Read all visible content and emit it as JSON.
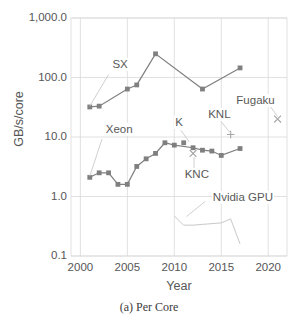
{
  "chart_data": {
    "type": "line",
    "title": "",
    "caption": "(a) Per Core",
    "xlabel": "Year",
    "ylabel": "GB/s/core",
    "yscale": "log",
    "ylim": [
      0.1,
      1000.0
    ],
    "xlim": [
      1999,
      2022
    ],
    "grid": true,
    "legend_position": "inline-annotations",
    "xticks": [
      "2000",
      "2005",
      "2010",
      "2015",
      "2020"
    ],
    "xtick_values": [
      2000,
      2005,
      2010,
      2015,
      2020
    ],
    "yticks": [
      "1,000.0",
      "100.0",
      "10.0",
      "1.0",
      "0.1"
    ],
    "ytick_values": [
      1000.0,
      100.0,
      10.0,
      1.0,
      0.1
    ],
    "series": [
      {
        "name": "SX",
        "marker": "square",
        "color": "#808080",
        "x": [
          2001,
          2002,
          2005,
          2006,
          2008,
          2013,
          2017
        ],
        "values": [
          32.0,
          33.0,
          64.0,
          75.0,
          250.0,
          64.0,
          145.0
        ]
      },
      {
        "name": "Xeon",
        "marker": "square",
        "color": "#7f7f7f",
        "x": [
          2001,
          2002,
          2003,
          2004,
          2005,
          2006,
          2007,
          2008,
          2009,
          2010,
          2012,
          2013,
          2014,
          2015,
          2017
        ],
        "values": [
          2.1,
          2.5,
          2.5,
          1.6,
          1.6,
          3.2,
          4.3,
          5.3,
          8.0,
          7.3,
          6.6,
          6.0,
          5.8,
          4.9,
          6.4
        ]
      },
      {
        "name": "K",
        "marker": "square",
        "color": "#808080",
        "x": [
          2011
        ],
        "values": [
          8.0
        ]
      },
      {
        "name": "KNC",
        "marker": "x",
        "color": "#a6a6a6",
        "x": [
          2012
        ],
        "values": [
          5.3
        ]
      },
      {
        "name": "KNL",
        "marker": "plus",
        "color": "#a6a6a6",
        "x": [
          2016
        ],
        "values": [
          11.0
        ]
      },
      {
        "name": "Fugaku",
        "marker": "x",
        "color": "#a6a6a6",
        "x": [
          2021
        ],
        "values": [
          20.0
        ]
      },
      {
        "name": "Nvidia GPU",
        "marker": "none",
        "color": "#c9c9c9",
        "x": [
          2010,
          2011,
          2012,
          2013,
          2015,
          2016,
          2017
        ],
        "values": [
          0.47,
          0.33,
          0.33,
          0.34,
          0.36,
          0.42,
          0.16
        ]
      }
    ],
    "annotations": [
      {
        "text": "SX",
        "x": 2003.3,
        "y": 165.0
      },
      {
        "text": "Xeon",
        "x": 2002.6,
        "y": 13.0
      },
      {
        "text": "K",
        "x": 2010.0,
        "y": 17.0
      },
      {
        "text": "KNC",
        "x": 2011.0,
        "y": 2.3
      },
      {
        "text": "KNL",
        "x": 2013.5,
        "y": 23.0
      },
      {
        "text": "Fugaku",
        "x": 2016.5,
        "y": 40.0
      },
      {
        "text": "Nvidia GPU",
        "x": 2014.0,
        "y": 0.93
      }
    ]
  }
}
